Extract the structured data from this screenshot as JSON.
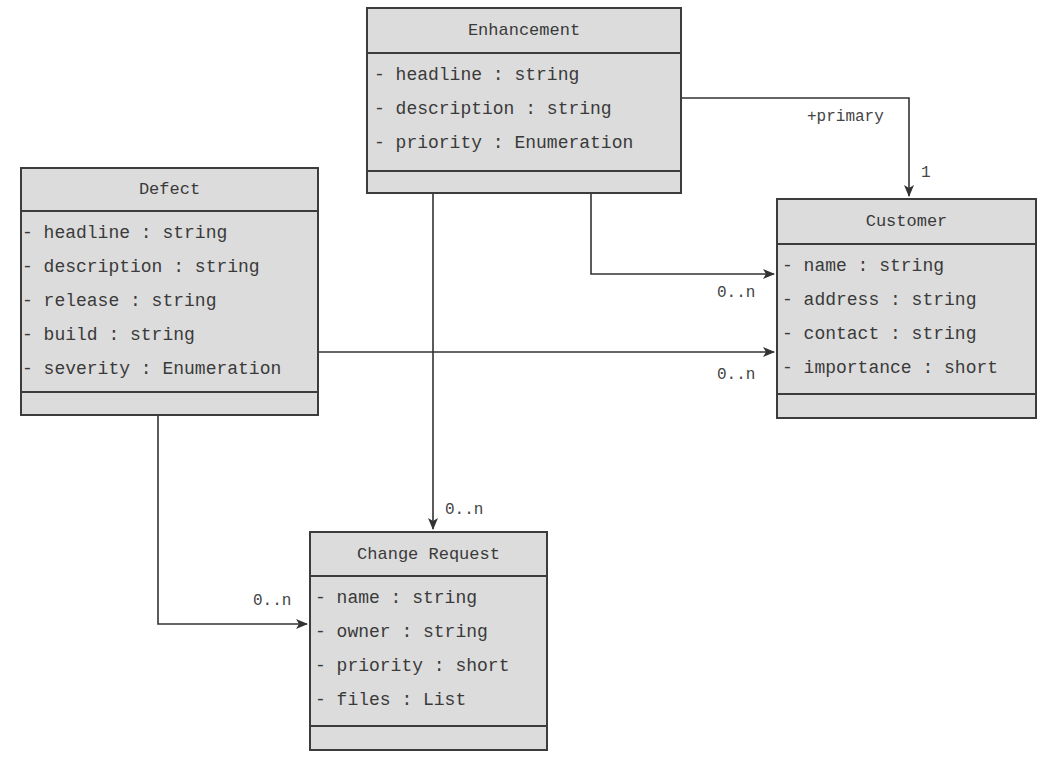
{
  "diagram": {
    "type": "uml-class-diagram",
    "classes": {
      "enhancement": {
        "name": "Enhancement",
        "attributes": [
          "- headline : string",
          "- description : string",
          "- priority : Enumeration"
        ],
        "operations": []
      },
      "defect": {
        "name": "Defect",
        "attributes": [
          "- headline : string",
          "- description : string",
          "- release : string",
          "- build : string",
          "- severity : Enumeration"
        ],
        "operations": []
      },
      "customer": {
        "name": "Customer",
        "attributes": [
          "- name : string",
          "- address : string",
          "- contact : string",
          "- importance : short"
        ],
        "operations": []
      },
      "change_request": {
        "name": "Change Request",
        "attributes": [
          "- name : string",
          "- owner : string",
          "- priority : short",
          "- files : List"
        ],
        "operations": []
      }
    },
    "associations": [
      {
        "from": "Enhancement",
        "to": "Customer",
        "role": "+primary",
        "multiplicity": "1"
      },
      {
        "from": "Enhancement",
        "to": "Customer",
        "multiplicity": "0..n"
      },
      {
        "from": "Defect",
        "to": "Customer",
        "multiplicity": "0..n"
      },
      {
        "from": "Enhancement",
        "to": "Change Request",
        "multiplicity": "0..n"
      },
      {
        "from": "Defect",
        "to": "Change Request",
        "multiplicity": "0..n"
      }
    ],
    "labels": {
      "primary_role": "+primary",
      "primary_mult": "1",
      "enh_cust_mult": "0..n",
      "def_cust_mult": "0..n",
      "enh_cr_mult": "0..n",
      "def_cr_mult": "0..n"
    },
    "colors": {
      "box_fill": "#dcdcdc",
      "box_border": "#3c3c3c",
      "line": "#333333",
      "background": "#ffffff"
    }
  }
}
